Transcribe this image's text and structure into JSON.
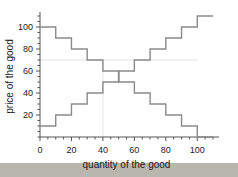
{
  "figure": {
    "page_background": "#b9b6ae",
    "plot_background": "#ffffff",
    "curve_color": "#8a8a8a",
    "axis_color": "#555555",
    "gridline_color": "#e2e2e2",
    "text_color": "#1a1a1a"
  },
  "chart_data": {
    "type": "line",
    "title": "",
    "xlabel": "quantity of the good",
    "ylabel": "price of the good",
    "xlim": [
      0,
      110
    ],
    "ylim": [
      0,
      110
    ],
    "xticks": [
      0,
      20,
      40,
      60,
      80,
      100
    ],
    "xtick_labels": [
      "0",
      "20",
      "40",
      "60",
      "80",
      "100"
    ],
    "x_minor_tick_step": 5,
    "yticks": [
      20,
      40,
      60,
      80,
      100
    ],
    "ytick_labels": [
      "20",
      "40",
      "60",
      "80",
      "100"
    ],
    "y_minor_tick_step": 5,
    "grid": false,
    "legend_position": "none",
    "step_width": 10,
    "gridlines": [
      {
        "orientation": "horizontal",
        "value": 70,
        "x_from": 0,
        "x_to": 100
      },
      {
        "orientation": "vertical",
        "value": 40,
        "y_from": 0,
        "y_to": 70
      }
    ],
    "annotations": [
      {
        "type": "equilibrium-bracket",
        "x": 50,
        "price_low": 50,
        "price_high": 60
      }
    ],
    "series": [
      {
        "name": "demand",
        "shape": "step-down",
        "x": [
          0,
          10,
          20,
          30,
          40,
          50,
          60,
          70,
          80,
          90,
          100
        ],
        "values": [
          100,
          90,
          80,
          70,
          60,
          50,
          40,
          30,
          20,
          10,
          0
        ]
      },
      {
        "name": "supply",
        "shape": "step-up",
        "x": [
          0,
          10,
          20,
          30,
          40,
          50,
          60,
          70,
          80,
          90,
          100
        ],
        "values": [
          10,
          20,
          30,
          40,
          50,
          60,
          70,
          80,
          90,
          100,
          110
        ]
      }
    ]
  }
}
